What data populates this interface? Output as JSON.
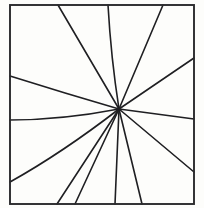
{
  "figure": {
    "canvas": {
      "width": 204,
      "height": 208
    },
    "background_color": "#fdfdfb",
    "line_color": "#1f1f22",
    "frame_color": "#2a2a2d",
    "line_width": 1.6,
    "frame_width": 1.9,
    "frame": {
      "x": 10,
      "y": 5,
      "width": 184,
      "height": 199
    },
    "vanishing_point": {
      "x": 119,
      "y": 109
    },
    "ray_count": 12,
    "rays": [
      {
        "name": "ray-top-left-steep",
        "edge": "top",
        "endpoint": {
          "x": 58,
          "y": 5
        },
        "control": {
          "x": 86,
          "y": 60
        },
        "curved": false
      },
      {
        "name": "ray-top-center-left",
        "edge": "top",
        "endpoint": {
          "x": 108,
          "y": 5
        },
        "control": {
          "x": 111,
          "y": 58
        },
        "curved": true
      },
      {
        "name": "ray-top-right",
        "edge": "top",
        "endpoint": {
          "x": 163,
          "y": 5
        },
        "control": {
          "x": 142,
          "y": 56
        },
        "curved": false
      },
      {
        "name": "ray-right-upper",
        "edge": "right",
        "endpoint": {
          "x": 194,
          "y": 58
        },
        "control": {
          "x": 157,
          "y": 83
        },
        "curved": false
      },
      {
        "name": "ray-right-horizontal",
        "edge": "right",
        "endpoint": {
          "x": 194,
          "y": 119
        },
        "control": {
          "x": 157,
          "y": 114
        },
        "curved": false
      },
      {
        "name": "ray-right-lower",
        "edge": "right",
        "endpoint": {
          "x": 194,
          "y": 172
        },
        "control": {
          "x": 157,
          "y": 140
        },
        "curved": false
      },
      {
        "name": "ray-bottom-right",
        "edge": "bottom",
        "endpoint": {
          "x": 142,
          "y": 204
        },
        "control": {
          "x": 131,
          "y": 157
        },
        "curved": false
      },
      {
        "name": "ray-bottom-center",
        "edge": "bottom",
        "endpoint": {
          "x": 115,
          "y": 204
        },
        "control": {
          "x": 117,
          "y": 157
        },
        "curved": false
      },
      {
        "name": "ray-bottom-left-inner",
        "edge": "bottom",
        "endpoint": {
          "x": 75,
          "y": 204
        },
        "control": {
          "x": 97,
          "y": 157
        },
        "curved": false
      },
      {
        "name": "ray-bottom-left-outer",
        "edge": "bottom",
        "endpoint": {
          "x": 57,
          "y": 204
        },
        "control": {
          "x": 88,
          "y": 157
        },
        "curved": false
      },
      {
        "name": "ray-left-lower-curved",
        "edge": "left",
        "endpoint": {
          "x": 10,
          "y": 182
        },
        "control": {
          "x": 62,
          "y": 153
        },
        "curved": true
      },
      {
        "name": "ray-left-horizontal-curved",
        "edge": "left",
        "endpoint": {
          "x": 10,
          "y": 120
        },
        "control": {
          "x": 62,
          "y": 120
        },
        "curved": true
      },
      {
        "name": "ray-left-upper",
        "edge": "left",
        "endpoint": {
          "x": 10,
          "y": 76
        },
        "control": {
          "x": 64,
          "y": 93
        },
        "curved": true
      }
    ]
  }
}
